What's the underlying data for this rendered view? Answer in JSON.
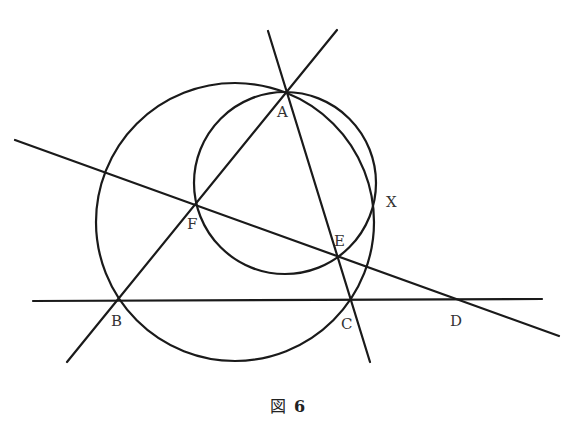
{
  "figure": {
    "caption_prefix": "図",
    "caption_number": "6",
    "points": {
      "A": {
        "label": "A",
        "x": 286,
        "y": 93
      },
      "B": {
        "label": "B",
        "x": 118,
        "y": 300
      },
      "C": {
        "label": "C",
        "x": 352,
        "y": 300
      },
      "D": {
        "label": "D",
        "x": 457,
        "y": 300
      },
      "E": {
        "label": "E",
        "x": 337,
        "y": 257
      },
      "F": {
        "label": "F",
        "x": 195,
        "y": 205
      },
      "X": {
        "label": "X",
        "x": 375,
        "y": 200
      }
    },
    "circles": [
      {
        "name": "circumcircle-ABC",
        "cx": 235,
        "cy": 222,
        "r": 139
      },
      {
        "name": "circle-AFE",
        "cx": 285,
        "cy": 183,
        "r": 91
      }
    ],
    "lines": [
      {
        "name": "line-BA",
        "x1": 67,
        "y1": 362,
        "x2": 337,
        "y2": 30
      },
      {
        "name": "line-AC",
        "x1": 268,
        "y1": 31,
        "x2": 370,
        "y2": 362
      },
      {
        "name": "line-BD",
        "x1": 33,
        "y1": 301,
        "x2": 542,
        "y2": 299
      },
      {
        "name": "line-FD",
        "x1": 15,
        "y1": 140,
        "x2": 559,
        "y2": 336
      }
    ]
  }
}
